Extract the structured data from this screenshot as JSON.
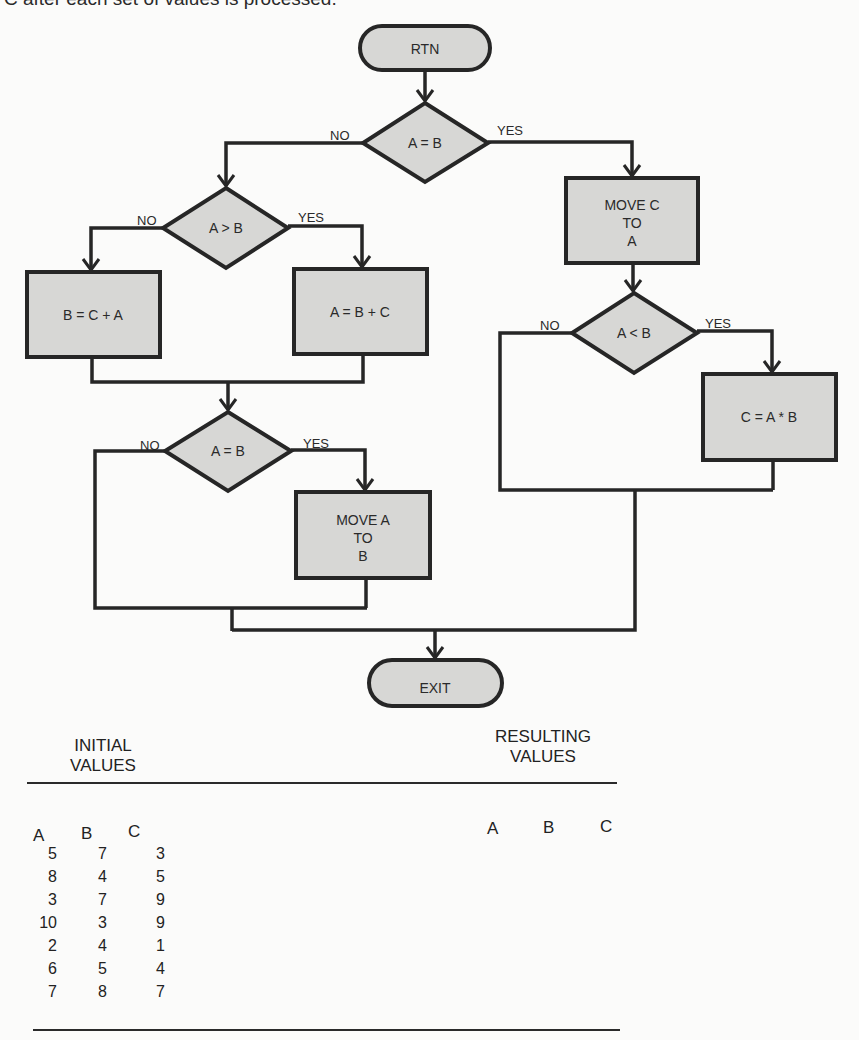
{
  "page": {
    "top_text": "C after each set of values is processed."
  },
  "flowchart": {
    "start": "RTN",
    "end": "EXIT",
    "decisions": {
      "d1": "A = B",
      "d2": "A > B",
      "d3": "A = B",
      "d4": "A < B"
    },
    "processes": {
      "move_c_to_a": [
        "MOVE C",
        "TO",
        "A"
      ],
      "b_eq_c_plus_a": "B = C + A",
      "a_eq_b_plus_c": "A = B + C",
      "move_a_to_b": [
        "MOVE A",
        "TO",
        "B"
      ],
      "c_eq_a_times_b": "C = A * B"
    },
    "branch_labels": {
      "no": "NO",
      "yes": "YES"
    }
  },
  "table": {
    "initial_header": [
      "INITIAL",
      "VALUES"
    ],
    "resulting_header": [
      "RESULTING",
      "VALUES"
    ],
    "columns": [
      "A",
      "B",
      "C"
    ],
    "initial_rows": [
      [
        "5",
        "7",
        "3"
      ],
      [
        "8",
        "4",
        "5"
      ],
      [
        "3",
        "7",
        "9"
      ],
      [
        "10",
        "3",
        "9"
      ],
      [
        "2",
        "4",
        "1"
      ],
      [
        "6",
        "5",
        "4"
      ],
      [
        "7",
        "8",
        "7"
      ]
    ],
    "resulting_columns": [
      "A",
      "B",
      "C"
    ]
  }
}
